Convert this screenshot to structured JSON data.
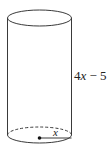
{
  "diagram": {
    "shape": "cylinder",
    "height_label": {
      "coef": "4",
      "var": "x",
      "rest": " − 5"
    },
    "radius_label": "x",
    "stroke_color": "#333333"
  }
}
